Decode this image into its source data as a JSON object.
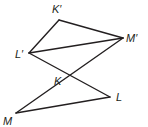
{
  "diagram": {
    "stroke_color": "#231f20",
    "background": "#ffffff",
    "points": {
      "K_prime": {
        "label": "K′",
        "x": 59,
        "y": 20,
        "lx": 52,
        "ly": 13
      },
      "M_prime": {
        "label": "M′",
        "x": 123,
        "y": 38,
        "lx": 126,
        "ly": 42
      },
      "L_prime": {
        "label": "L′",
        "x": 29,
        "y": 53,
        "lx": 15,
        "ly": 58
      },
      "K": {
        "label": "K",
        "x": 70,
        "y": 76,
        "lx": 54,
        "ly": 85
      },
      "L": {
        "label": "L",
        "x": 110,
        "y": 97,
        "lx": 116,
        "ly": 101
      },
      "M": {
        "label": "M",
        "x": 16,
        "y": 113,
        "lx": 3,
        "ly": 125
      }
    },
    "segments": [
      {
        "from": "K_prime",
        "to": "M_prime"
      },
      {
        "from": "K_prime",
        "to": "L_prime"
      },
      {
        "from": "L_prime",
        "to": "M_prime"
      },
      {
        "from": "L_prime",
        "to": "L"
      },
      {
        "from": "M_prime",
        "to": "M"
      },
      {
        "from": "M",
        "to": "L"
      }
    ]
  }
}
